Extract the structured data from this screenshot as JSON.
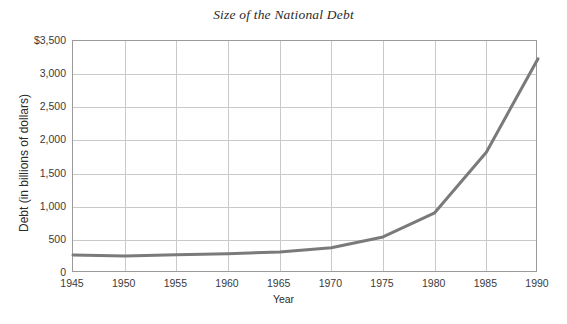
{
  "chart_data": {
    "type": "line",
    "title": "Size of the National Debt",
    "xlabel": "Year",
    "ylabel": "Debt (in billions of dollars)",
    "x": [
      1945,
      1950,
      1955,
      1960,
      1965,
      1970,
      1975,
      1980,
      1985,
      1990
    ],
    "values": [
      270,
      257,
      274,
      291,
      318,
      380,
      544,
      908,
      1823,
      3233
    ],
    "series": [
      {
        "name": "National Debt",
        "values": [
          270,
          257,
          274,
          291,
          318,
          380,
          544,
          908,
          1823,
          3233
        ]
      }
    ],
    "xlim": [
      1945,
      1990
    ],
    "ylim": [
      0,
      3500
    ],
    "xticks": [
      1945,
      1950,
      1955,
      1960,
      1965,
      1970,
      1975,
      1980,
      1985,
      1990
    ],
    "xtick_labels": [
      "1945",
      "1950",
      "1955",
      "1960",
      "1965",
      "1970",
      "1975",
      "1980",
      "1985",
      "1990"
    ],
    "yticks": [
      0,
      500,
      1000,
      1500,
      2000,
      2500,
      3000,
      3500
    ],
    "ytick_labels": [
      "0",
      "500",
      "1,000",
      "1,500",
      "2,000",
      "2,500",
      "3,000",
      "$3,500"
    ],
    "grid": true,
    "legend": false,
    "line_color": "#7a7a7a",
    "grid_color": "#c9c9c9",
    "axis_color": "#9a9a9a",
    "background": "#ffffff"
  }
}
